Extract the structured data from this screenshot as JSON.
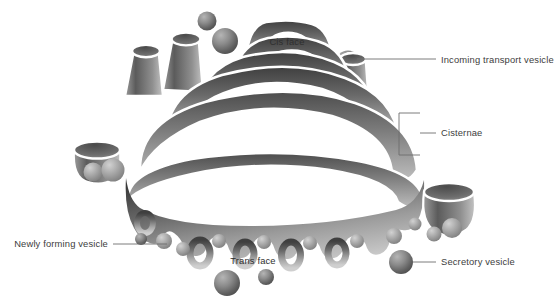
{
  "figure": {
    "width": 555,
    "height": 302,
    "background_color": "#ffffff"
  },
  "palette": {
    "membrane_dark": "#4a4a4a",
    "membrane_mid": "#808080",
    "membrane_light": "#c8c8c8",
    "lumen_outline": "#ffffff",
    "vesicle_dark": "#5a5a5a",
    "vesicle_light": "#a8a8a8",
    "label_text": "#3d3d3d",
    "leader_line": "#6d6d6d"
  },
  "labels": {
    "external": [
      {
        "id": "incoming-transport-vesicle",
        "text": "Incoming transport vesicle",
        "text_x": 441,
        "text_y": 63,
        "anchor": "start",
        "leader": "M 357 59 L 436 59"
      },
      {
        "id": "cisternae",
        "text": "Cisternae",
        "text_x": 441,
        "text_y": 136,
        "anchor": "start",
        "leader": "M 420 133 L 436 133"
      },
      {
        "id": "newly-forming-vesicle",
        "text": "Newly forming vesicle",
        "text_x": 108,
        "text_y": 247,
        "anchor": "end",
        "leader": "M 113 244 L 167 244"
      },
      {
        "id": "secretory-vesicle",
        "text": "Secretory vesicle",
        "text_x": 441,
        "text_y": 265,
        "anchor": "start",
        "leader": "M 413 262 L 436 262"
      }
    ],
    "internal": [
      {
        "id": "cis-face",
        "text": "Cis face",
        "text_x": 287,
        "text_y": 45,
        "anchor": "middle"
      },
      {
        "id": "trans-face",
        "text": "Trans face",
        "text_x": 253,
        "text_y": 264,
        "anchor": "middle"
      }
    ]
  },
  "bracket": {
    "id": "cisternae-bracket",
    "path": "M 420 113 L 399 113 L 399 155 L 420 155",
    "description": "square bracket grouping the stacked cisternae"
  },
  "structure": {
    "cisternae_count": 6,
    "cis_face_position": "top",
    "trans_face_position": "bottom",
    "notes": "Stacked flattened membrane sacs with dilated rims, budding vesicles along the trans face and free spherical transport vesicles around the stack."
  },
  "vesicles": {
    "free_spheres": [
      {
        "id": "v-top-small",
        "cx": 207,
        "cy": 21,
        "r": 9.5
      },
      {
        "id": "v-top-large",
        "cx": 225,
        "cy": 41,
        "r": 13.0
      },
      {
        "id": "v-incoming",
        "cx": 348,
        "cy": 63,
        "r": 12.5
      },
      {
        "id": "v-left-tiny",
        "cx": 137,
        "cy": 80,
        "r": 7.0
      },
      {
        "id": "v-left-cup-a",
        "cx": 93,
        "cy": 172,
        "r": 9.5
      },
      {
        "id": "v-left-cup-b",
        "cx": 113,
        "cy": 170,
        "r": 11.5
      },
      {
        "id": "v-left-small",
        "cx": 141,
        "cy": 239,
        "r": 6.0
      },
      {
        "id": "v-right-cup-a",
        "cx": 434,
        "cy": 234,
        "r": 7.5
      },
      {
        "id": "v-right-cup-b",
        "cx": 452,
        "cy": 228,
        "r": 10.0
      },
      {
        "id": "v-secretory",
        "cx": 401,
        "cy": 262,
        "r": 12.0
      },
      {
        "id": "v-bottom-large",
        "cx": 227,
        "cy": 283,
        "r": 13.0
      },
      {
        "id": "v-bottom-small",
        "cx": 266,
        "cy": 277,
        "r": 8.0
      }
    ]
  }
}
